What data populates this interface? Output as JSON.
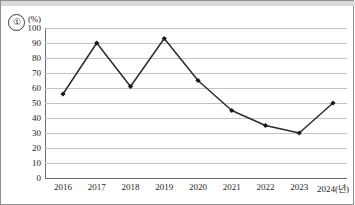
{
  "figure": {
    "item_number": "①",
    "unit_label": "(%)"
  },
  "chart_data": {
    "type": "line",
    "title": "",
    "subtitle": "",
    "xlabel": "",
    "ylabel": "(%)",
    "x_axis_suffix": "(년)",
    "categories": [
      "2016",
      "2017",
      "2018",
      "2019",
      "2020",
      "2021",
      "2022",
      "2023",
      "2024(년)"
    ],
    "values": [
      56,
      90,
      61,
      93,
      65,
      45,
      35,
      30,
      50
    ],
    "series": [
      {
        "name": "",
        "values": [
          56,
          90,
          61,
          93,
          65,
          45,
          35,
          30,
          50
        ]
      }
    ],
    "ylim": [
      0,
      100
    ],
    "y_ticks": [
      0,
      10,
      20,
      30,
      40,
      50,
      60,
      70,
      80,
      90,
      100
    ],
    "y_tick_labels": [
      "0",
      "10",
      "20",
      "30",
      "40",
      "50",
      "60",
      "70",
      "80",
      "90",
      "100"
    ],
    "grid": true,
    "grid_axis": "y",
    "legend": false,
    "legend_position": "none",
    "marker": "diamond",
    "line_color": "#2b2b2b",
    "marker_color": "#1a1a1a",
    "gridline_color": "#c2c2c2",
    "axis_color": "#6d6d6d",
    "background_color": "#ffffff",
    "annotations": []
  }
}
